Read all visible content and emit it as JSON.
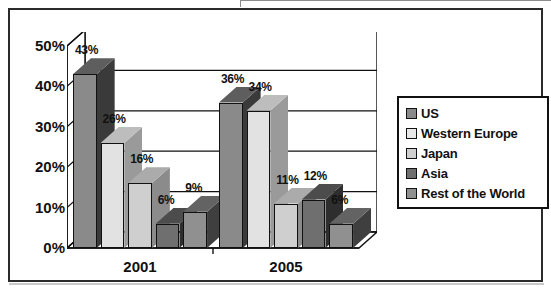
{
  "page": {
    "clipped_top_text": "ues of Asia will increase."
  },
  "chart_data": {
    "type": "bar",
    "title": "",
    "subtitle": "",
    "xlabel": "",
    "ylabel": "",
    "categories": [
      "2001",
      "2005"
    ],
    "ylim": [
      0,
      50
    ],
    "ytick_labels": [
      "0%",
      "10%",
      "20%",
      "30%",
      "40%",
      "50%"
    ],
    "ytick_values": [
      0,
      10,
      20,
      30,
      40,
      50
    ],
    "grid": true,
    "grid_axis": "y",
    "legend_position": "right",
    "value_suffix": "%",
    "style": "3d-column",
    "series": [
      {
        "name": "US",
        "color": "#8a8a8a",
        "side_color": "#3a3a3a",
        "top_color": "#5e5e5e",
        "values": [
          43,
          36
        ],
        "labels": [
          "43%",
          "36%"
        ]
      },
      {
        "name": "Western Europe",
        "color": "#e2e2e2",
        "side_color": "#9a9a9a",
        "top_color": "#bdbdbd",
        "values": [
          26,
          34
        ],
        "labels": [
          "26%",
          "34%"
        ]
      },
      {
        "name": "Japan",
        "color": "#cfcfcf",
        "side_color": "#8b8b8b",
        "top_color": "#ababab",
        "values": [
          16,
          11
        ],
        "labels": [
          "16%",
          "11%"
        ]
      },
      {
        "name": "Asia",
        "color": "#6f6f6f",
        "side_color": "#2e2e2e",
        "top_color": "#4c4c4c",
        "values": [
          6,
          12
        ],
        "labels": [
          "6%",
          "12%"
        ]
      },
      {
        "name": "Rest of the World",
        "color": "#909090",
        "side_color": "#3f3f3f",
        "top_color": "#636363",
        "values": [
          9,
          6
        ],
        "labels": [
          "9%",
          "6%"
        ]
      }
    ]
  },
  "legend": {
    "items": [
      {
        "label": "US",
        "color": "#8a8a8a"
      },
      {
        "label": "Western Europe",
        "color": "#e8e8e8"
      },
      {
        "label": "Japan",
        "color": "#cfcfcf"
      },
      {
        "label": "Asia",
        "color": "#6f6f6f"
      },
      {
        "label": "Rest of the World",
        "color": "#909090"
      }
    ]
  }
}
